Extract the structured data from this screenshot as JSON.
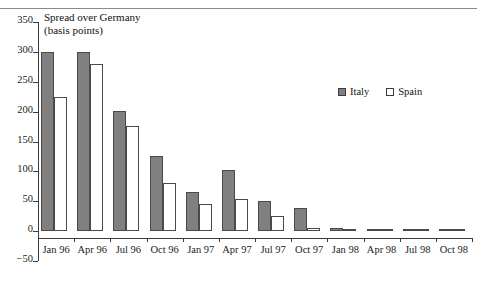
{
  "chart_data": {
    "type": "bar",
    "title": "Spread over Germany\n(basis points)",
    "xlabel": "",
    "ylabel": "",
    "ylim": [
      -50,
      350
    ],
    "ytick_values": [
      350,
      300,
      250,
      200,
      150,
      100,
      50,
      0,
      -50
    ],
    "ytick_labels": [
      "350",
      "300",
      "250",
      "200",
      "150",
      "100",
      "50",
      "0",
      "−50"
    ],
    "grid": false,
    "legend_position": "upper-right-inside",
    "categories": [
      "Jan 96",
      "Apr 96",
      "Jul 96",
      "Oct 96",
      "Jan 97",
      "Apr 97",
      "Jul 97",
      "Oct 97",
      "Jan 98",
      "Apr 98",
      "Jul 98",
      "Oct 98"
    ],
    "series": [
      {
        "name": "Italy",
        "color": "#808080",
        "values": [
          300,
          300,
          201,
          125,
          66,
          102,
          50,
          38,
          5,
          2,
          3,
          0
        ]
      },
      {
        "name": "Spain",
        "color": "#ffffff",
        "values": [
          225,
          280,
          176,
          81,
          46,
          54,
          25,
          5,
          3,
          1,
          1,
          0
        ]
      }
    ]
  },
  "legend": {
    "items": [
      {
        "label": "Italy"
      },
      {
        "label": "Spain"
      }
    ]
  }
}
